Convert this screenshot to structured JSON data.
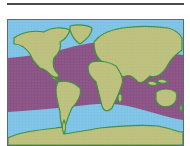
{
  "map": {
    "title": "",
    "projection": "world",
    "description": "World map highlighting the tropical zone band",
    "legend": [],
    "colors": {
      "ocean": "#7ec3e6",
      "ocean_light": "#a9d8f0",
      "land": "#bcc07c",
      "coast": "#3e8f3e",
      "highlight_band": "#8b4c80",
      "frame": "#5a6a78",
      "rule": "#4a4a4a"
    },
    "highlight_band": {
      "label": "",
      "region": "tropics"
    }
  }
}
